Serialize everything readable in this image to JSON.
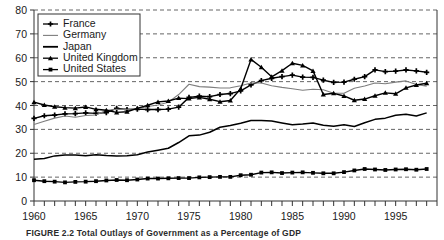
{
  "figure": {
    "caption": "FIGURE 2.2  Total Outlays of Government as a Percentage of GDP"
  },
  "chart_data": {
    "type": "line",
    "title": "",
    "xlabel": "",
    "ylabel": "",
    "xlim": [
      1960,
      1999
    ],
    "ylim": [
      0,
      80
    ],
    "grid": "horizontal-dashed",
    "legend_position": "top-left",
    "ytick_labels": [
      "0",
      "10",
      "20",
      "30",
      "40",
      "50",
      "60",
      "70",
      "80"
    ],
    "ytick_values": [
      0,
      10,
      20,
      30,
      40,
      50,
      60,
      70,
      80
    ],
    "xtick_labels": [
      "1960",
      "1965",
      "1970",
      "1975",
      "1980",
      "1985",
      "1990",
      "1995"
    ],
    "xtick_values": [
      1960,
      1965,
      1970,
      1975,
      1980,
      1985,
      1990,
      1995
    ],
    "x": [
      1960,
      1961,
      1962,
      1963,
      1964,
      1965,
      1966,
      1967,
      1968,
      1969,
      1970,
      1971,
      1972,
      1973,
      1974,
      1975,
      1976,
      1977,
      1978,
      1979,
      1980,
      1981,
      1982,
      1983,
      1984,
      1985,
      1986,
      1987,
      1988,
      1989,
      1990,
      1991,
      1992,
      1993,
      1994,
      1995,
      1996,
      1997,
      1998
    ],
    "series": [
      {
        "name": "France",
        "marker": "plus",
        "color": "#000000",
        "values": [
          34.6,
          35.7,
          36.0,
          36.5,
          36.6,
          36.9,
          36.7,
          37.0,
          38.8,
          38.3,
          38.5,
          38.3,
          38.3,
          38.5,
          39.3,
          43.4,
          43.9,
          43.7,
          44.6,
          45.0,
          46.1,
          48.6,
          50.4,
          51.4,
          52.1,
          52.7,
          51.9,
          51.8,
          50.6,
          49.7,
          49.8,
          51.0,
          52.1,
          54.9,
          54.2,
          54.4,
          54.9,
          54.5,
          53.9
        ]
      },
      {
        "name": "Germany",
        "marker": "none",
        "color": "#7d7d7d",
        "values": [
          32.0,
          33.4,
          34.7,
          35.6,
          35.1,
          35.8,
          36.0,
          38.0,
          38.4,
          38.3,
          38.6,
          39.6,
          40.2,
          41.4,
          44.6,
          48.9,
          47.9,
          47.7,
          47.3,
          47.4,
          48.3,
          49.4,
          49.4,
          48.3,
          47.6,
          47.0,
          46.4,
          46.8,
          46.6,
          45.1,
          45.1,
          47.2,
          48.2,
          49.4,
          49.1,
          49.8,
          50.3,
          48.8,
          48.1
        ]
      },
      {
        "name": "Japan",
        "marker": "none",
        "color": "#000000",
        "values": [
          17.5,
          17.8,
          18.9,
          19.3,
          19.3,
          19.0,
          19.4,
          19.1,
          18.9,
          19.0,
          19.4,
          20.5,
          21.3,
          22.1,
          24.5,
          27.3,
          27.6,
          28.8,
          30.9,
          31.6,
          32.6,
          33.7,
          33.7,
          33.5,
          32.7,
          31.9,
          32.2,
          32.7,
          31.7,
          31.3,
          31.9,
          31.2,
          32.8,
          34.2,
          34.7,
          35.9,
          36.3,
          35.6,
          36.9
        ]
      },
      {
        "name": "United Kingdom",
        "marker": "triangle",
        "color": "#000000",
        "values": [
          41.4,
          40.2,
          39.5,
          39.1,
          38.9,
          39.4,
          38.4,
          38.0,
          37.1,
          37.4,
          38.8,
          40.1,
          41.5,
          41.9,
          43.1,
          42.9,
          43.4,
          42.6,
          41.6,
          42.1,
          47.0,
          59.3,
          56.0,
          52.0,
          54.6,
          57.7,
          56.8,
          54.5,
          44.6,
          45.1,
          44.0,
          42.2,
          42.7,
          44.1,
          45.3,
          44.9,
          47.4,
          48.6,
          49.3
        ]
      },
      {
        "name": "United States",
        "marker": "square",
        "color": "#000000",
        "values": [
          8.7,
          8.3,
          8.1,
          7.8,
          8.0,
          8.1,
          8.3,
          8.6,
          8.8,
          8.7,
          9.0,
          9.4,
          9.4,
          9.5,
          9.6,
          9.6,
          9.9,
          10.0,
          10.1,
          10.1,
          10.8,
          11.0,
          11.9,
          12.0,
          11.7,
          11.9,
          12.0,
          11.8,
          11.6,
          11.6,
          12.1,
          12.8,
          13.4,
          13.2,
          13.0,
          13.2,
          13.3,
          13.1,
          13.4
        ]
      }
    ]
  },
  "legend": {
    "items": [
      {
        "label": "France"
      },
      {
        "label": "Germany"
      },
      {
        "label": "Japan"
      },
      {
        "label": "United Kingdom"
      },
      {
        "label": "United States"
      }
    ]
  }
}
